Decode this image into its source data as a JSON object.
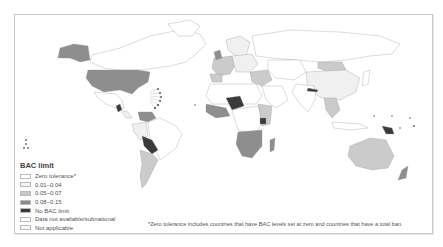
{
  "legend": {
    "title": "BAC limit",
    "items": [
      {
        "label": "Zero tolerance*",
        "color": "#ffffff"
      },
      {
        "label": "0.01–0.04",
        "color": "#f2f2f2"
      },
      {
        "label": "0.05–0.07",
        "color": "#c9c9c9"
      },
      {
        "label": "0.08–0.15",
        "color": "#8c8c8c"
      },
      {
        "label": "No BAC limit",
        "color": "#3a3a3a"
      },
      {
        "label": "Data not available/subnational",
        "color": "#ffffff"
      },
      {
        "label": "Not applicable",
        "color": "#f7f7f7"
      }
    ]
  },
  "footnote": "*Zero tolerance includes countries that have BAC levels set at zero and countries that have a total ban.",
  "colors": {
    "zero": "#ffffff",
    "low": "#f0f0f0",
    "mid": "#cbcbcb",
    "high": "#8e8e8e",
    "none": "#3a3a3a",
    "border": "#9a9a9a",
    "frame": "#c8c8c8"
  },
  "regions": [
    {
      "name": "Canada/Greenland",
      "category": "Data not available/subnational"
    },
    {
      "name": "Alaska/USA",
      "category": "0.08–0.15"
    },
    {
      "name": "Mexico",
      "category": "Data not available/subnational"
    },
    {
      "name": "Guatemala",
      "category": "No BAC limit"
    },
    {
      "name": "Venezuela",
      "category": "0.08–0.15"
    },
    {
      "name": "Brazil",
      "category": "Zero tolerance*"
    },
    {
      "name": "Bolivia",
      "category": "No BAC limit"
    },
    {
      "name": "Argentina/Chile",
      "category": "0.05–0.07"
    },
    {
      "name": "Europe",
      "category": "0.05–0.07"
    },
    {
      "name": "Russia",
      "category": "Zero tolerance*"
    },
    {
      "name": "Niger",
      "category": "No BAC limit"
    },
    {
      "name": "Uganda",
      "category": "No BAC limit"
    },
    {
      "name": "Southern Africa",
      "category": "0.08–0.15"
    },
    {
      "name": "Mongolia",
      "category": "0.05–0.07"
    },
    {
      "name": "China",
      "category": "0.01–0.04"
    },
    {
      "name": "Nepal",
      "category": "No BAC limit"
    },
    {
      "name": "Papua New Guinea",
      "category": "No BAC limit"
    },
    {
      "name": "Australia",
      "category": "0.05–0.07"
    },
    {
      "name": "New Zealand",
      "category": "0.08–0.15"
    }
  ]
}
